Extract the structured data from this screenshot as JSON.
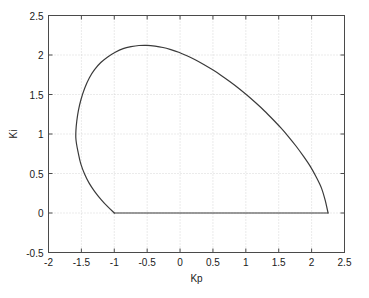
{
  "chart_data": {
    "type": "line",
    "title": "",
    "xlabel": "Kp",
    "ylabel": "Ki",
    "xlim": [
      -2,
      2.5
    ],
    "ylim": [
      -0.5,
      2.5
    ],
    "xticks": [
      -2,
      -1.5,
      -1,
      -0.5,
      0,
      0.5,
      1,
      1.5,
      2,
      2.5
    ],
    "xticklabels": [
      "-2",
      "-1.5",
      "-1",
      "-0.5",
      "0",
      "0.5",
      "1",
      "1.5",
      "2",
      "2.5"
    ],
    "yticks": [
      -0.5,
      0,
      0.5,
      1,
      1.5,
      2,
      2.5
    ],
    "yticklabels": [
      "-0.5",
      "0",
      "0.5",
      "1",
      "1.5",
      "2",
      "2.5"
    ],
    "grid": true,
    "grid_style": "dotted",
    "grid_color": "#cccccc",
    "legend": null,
    "line_color": "#3a3a3a",
    "line_width": 1.2,
    "axes_color": "#4a4a4a",
    "background": "#ffffff",
    "series": [
      {
        "name": "stability-boundary",
        "comment": "closed stability region boundary in (Kp,Ki) plane",
        "x": [
          -1.0,
          -1.1,
          -1.2,
          -1.3,
          -1.38,
          -1.45,
          -1.51,
          -1.55,
          -1.575,
          -1.585,
          -1.583,
          -1.57,
          -1.545,
          -1.505,
          -1.45,
          -1.38,
          -1.3,
          -1.205,
          -1.1,
          -0.985,
          -0.865,
          -0.745,
          -0.625,
          -0.5,
          -0.38,
          -0.26,
          -0.14,
          -0.02,
          0.105,
          0.23,
          0.36,
          0.49,
          0.62,
          0.755,
          0.89,
          1.02,
          1.15,
          1.28,
          1.405,
          1.53,
          1.65,
          1.765,
          1.875,
          1.98,
          2.07,
          2.15,
          2.205,
          2.25
        ],
        "y": [
          0.0,
          0.08,
          0.17,
          0.275,
          0.375,
          0.49,
          0.625,
          0.77,
          0.88,
          0.96,
          1.045,
          1.165,
          1.3,
          1.44,
          1.58,
          1.71,
          1.815,
          1.905,
          1.975,
          2.035,
          2.08,
          2.105,
          2.12,
          2.122,
          2.112,
          2.095,
          2.068,
          2.035,
          1.99,
          1.94,
          1.88,
          1.815,
          1.745,
          1.665,
          1.58,
          1.49,
          1.395,
          1.295,
          1.19,
          1.08,
          0.965,
          0.845,
          0.72,
          0.59,
          0.455,
          0.315,
          0.165,
          0.0
        ]
      },
      {
        "name": "baseline-segment",
        "comment": "horizontal segment along Ki = 0",
        "x": [
          -1.0,
          2.25
        ],
        "y": [
          0.0,
          0.0
        ]
      }
    ]
  },
  "figure": {
    "xlabel_text": "Kp",
    "ylabel_text": "Ki"
  }
}
